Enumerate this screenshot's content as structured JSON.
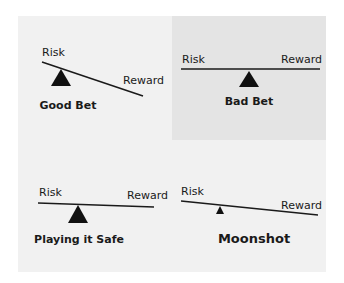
{
  "diagram": {
    "colors": {
      "background": "#ffffff",
      "panel": "#f1f1f1",
      "panel_dark": "#e4e4e4",
      "ink": "#1a1a1a"
    },
    "panels": [
      {
        "title": "Good Bet",
        "left_label": "Risk",
        "right_label": "Reward",
        "tilt": "down-right",
        "fulcrum": "left",
        "fulcrum_size": "large"
      },
      {
        "title": "Bad Bet",
        "left_label": "Risk",
        "right_label": "Reward",
        "tilt": "level",
        "fulcrum": "center",
        "fulcrum_size": "large"
      },
      {
        "title": "Playing it Safe",
        "left_label": "Risk",
        "right_label": "Reward",
        "tilt": "slight down-right",
        "fulcrum": "left",
        "fulcrum_size": "large"
      },
      {
        "title": "Moonshot",
        "left_label": "Risk",
        "right_label": "Reward",
        "tilt": "down-right",
        "fulcrum": "left",
        "fulcrum_size": "small"
      }
    ]
  }
}
